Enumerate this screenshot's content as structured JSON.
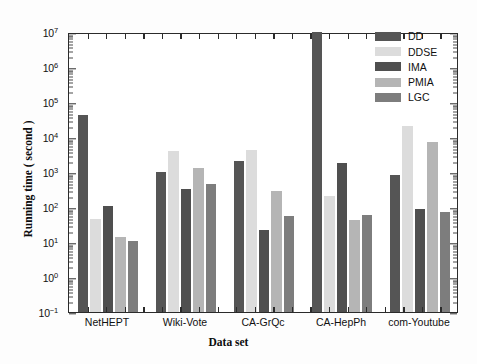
{
  "chart_data": {
    "type": "bar",
    "title": "",
    "xlabel": "Data set",
    "ylabel": "Running time ( second )",
    "yscale": "log",
    "ylim": [
      0.1,
      10000000
    ],
    "grid": false,
    "legend_position": "top-right",
    "categories": [
      "NetHEPT",
      "Wiki-Vote",
      "CA-GrQc",
      "CA-HepPh",
      "com-Youtube"
    ],
    "ytick_labels": [
      "10⁻¹",
      "10⁰",
      "10¹",
      "10²",
      "10³",
      "10⁴",
      "10⁵",
      "10⁶",
      "10⁷"
    ],
    "ytick_values": [
      0.1,
      1,
      10,
      100,
      1000,
      10000,
      100000,
      1000000,
      10000000
    ],
    "series": [
      {
        "name": "DD",
        "color": "#555555",
        "values": [
          43000,
          1000,
          2000,
          10000000,
          800
        ]
      },
      {
        "name": "DDSE",
        "color": "#dcdcdc",
        "values": [
          45,
          4000,
          4200,
          210,
          20000
        ]
      },
      {
        "name": "IMA",
        "color": "#4f4f4f",
        "values": [
          110,
          320,
          22,
          1800,
          85
        ]
      },
      {
        "name": "PMIA",
        "color": "#b5b5b5",
        "values": [
          14,
          1300,
          290,
          42,
          7000
        ]
      },
      {
        "name": "LGC",
        "color": "#7d7d7d",
        "values": [
          10.5,
          440,
          55,
          60,
          70
        ]
      }
    ]
  },
  "axis": {
    "frame_color": "#2b2b2b"
  }
}
